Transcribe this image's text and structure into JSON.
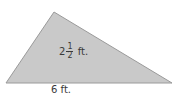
{
  "figure": {
    "shape": "triangle",
    "vertices": [
      [
        54,
        12
      ],
      [
        6,
        83
      ],
      [
        172,
        83
      ]
    ],
    "fill_color": "#c9c9c9",
    "stroke_color": "#9a9a9a",
    "height_label": {
      "whole": "2",
      "numerator": "1",
      "denominator": "2",
      "unit": "ft."
    },
    "base_label": "6 ft."
  }
}
